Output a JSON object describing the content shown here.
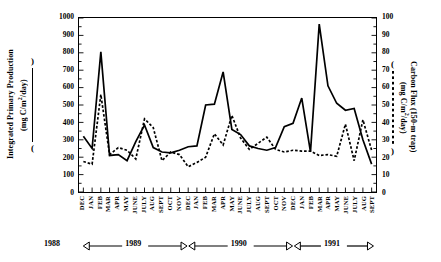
{
  "axes": {
    "left": {
      "title": "Integrated Primary Production",
      "units": "(mg C/m2/day)",
      "units_pre": "(mg C/m",
      "units_sup": "2",
      "units_post": "/day)",
      "paren_open": ")",
      "paren_close": "(",
      "ticks": [
        "1000",
        "900",
        "800",
        "700",
        "600",
        "500",
        "400",
        "300",
        "200",
        "100",
        "0"
      ]
    },
    "right": {
      "title": "Carbon Flux (150-m trap)",
      "units": "(mg C/m2/day)",
      "units_pre": "(mg C/m",
      "units_sup": "2",
      "units_post": "/day)",
      "paren_open": "(",
      "paren_close": ")",
      "ticks": [
        "100",
        "90",
        "80",
        "70",
        "60",
        "50",
        "40",
        "30",
        "20",
        "10",
        "0"
      ]
    }
  },
  "years": [
    {
      "label": "1988",
      "kind": "text-only"
    },
    {
      "label": "1989",
      "kind": "span"
    },
    {
      "label": "1990",
      "kind": "span"
    },
    {
      "label": "1991",
      "kind": "span"
    }
  ],
  "chart_data": {
    "type": "line",
    "title": "",
    "xlabel": "",
    "ylabel": "Integrated Primary Production (mg C/m2/day)",
    "y2label": "Carbon Flux (150-m trap) (mg C/m2/day)",
    "ylim": [
      0,
      1000
    ],
    "y2lim": [
      0,
      100
    ],
    "grid": false,
    "legend": "axis-titles",
    "categories": [
      "DEC",
      "JAN",
      "FEB",
      "MAR",
      "APR",
      "MAY",
      "JUNE",
      "JULY",
      "AUG",
      "SEPT",
      "OCT",
      "NOV",
      "DEC",
      "JAN",
      "FEB",
      "MAR",
      "APR",
      "MAY",
      "JUNE",
      "JULY",
      "AUG",
      "SEPT",
      "OCT",
      "NOV",
      "DEC",
      "JAN",
      "FEB",
      "MAR",
      "APR",
      "MAY",
      "JUNE",
      "JULY",
      "AUG",
      "SEPT"
    ],
    "category_years": [
      "1988",
      "1989",
      "1989",
      "1989",
      "1989",
      "1989",
      "1989",
      "1989",
      "1989",
      "1989",
      "1989",
      "1989",
      "1989",
      "1990",
      "1990",
      "1990",
      "1990",
      "1990",
      "1990",
      "1990",
      "1990",
      "1990",
      "1990",
      "1990",
      "1990",
      "1991",
      "1991",
      "1991",
      "1991",
      "1991",
      "1991",
      "1991",
      "1991",
      "1991"
    ],
    "series": [
      {
        "name": "Integrated Primary Production",
        "axis": "left",
        "style": "solid",
        "color": "#000000",
        "units": "mg C/m2/day",
        "values": [
          320,
          250,
          805,
          210,
          215,
          180,
          290,
          385,
          255,
          230,
          225,
          240,
          260,
          265,
          500,
          505,
          690,
          360,
          330,
          265,
          250,
          240,
          255,
          375,
          395,
          540,
          230,
          965,
          610,
          510,
          470,
          480,
          300,
          160
        ]
      },
      {
        "name": "Carbon Flux (150-m trap)",
        "axis": "right",
        "style": "dotted",
        "color": "#000000",
        "units": "mg C/m2/day",
        "values": [
          17.5,
          16.0,
          56.0,
          21.5,
          25.5,
          24.0,
          19.0,
          42.0,
          37.0,
          18.0,
          23.0,
          21.5,
          14.5,
          17.0,
          20.0,
          33.5,
          27.0,
          44.0,
          31.0,
          24.5,
          28.0,
          31.5,
          24.5,
          23.0,
          24.0,
          23.5,
          23.5,
          21.0,
          21.5,
          20.5,
          39.0,
          18.0,
          41.5,
          24.0
        ]
      }
    ],
    "annotations": [
      {
        "text": "1988",
        "position": "below-axis"
      },
      {
        "text": "1989",
        "position": "below-axis"
      },
      {
        "text": "1990",
        "position": "below-axis"
      },
      {
        "text": "1991",
        "position": "below-axis"
      }
    ]
  }
}
